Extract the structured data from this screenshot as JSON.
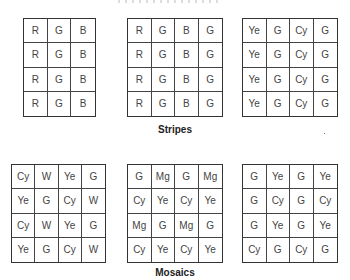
{
  "sections": [
    {
      "title": "Stripes",
      "grids": [
        {
          "name": "rgb-stripe",
          "columns": 3,
          "rows": [
            [
              "R",
              "G",
              "B"
            ],
            [
              "R",
              "G",
              "B"
            ],
            [
              "R",
              "G",
              "B"
            ],
            [
              "R",
              "G",
              "B"
            ]
          ]
        },
        {
          "name": "rgbg-stripe",
          "columns": 4,
          "rows": [
            [
              "R",
              "G",
              "B",
              "G"
            ],
            [
              "R",
              "G",
              "B",
              "G"
            ],
            [
              "R",
              "G",
              "B",
              "G"
            ],
            [
              "R",
              "G",
              "B",
              "G"
            ]
          ]
        },
        {
          "name": "yegcyg-stripe",
          "columns": 4,
          "rows": [
            [
              "Ye",
              "G",
              "Cy",
              "G"
            ],
            [
              "Ye",
              "G",
              "Cy",
              "G"
            ],
            [
              "Ye",
              "G",
              "Cy",
              "G"
            ],
            [
              "Ye",
              "G",
              "Cy",
              "G"
            ]
          ]
        }
      ]
    },
    {
      "title": "Mosaics",
      "grids": [
        {
          "name": "cywyeg-mosaic",
          "columns": 4,
          "rows": [
            [
              "Cy",
              "W",
              "Ye",
              "G"
            ],
            [
              "Ye",
              "G",
              "Cy",
              "W"
            ],
            [
              "Cy",
              "W",
              "Ye",
              "G"
            ],
            [
              "Ye",
              "G",
              "Cy",
              "W"
            ]
          ]
        },
        {
          "name": "gmgcyye-mosaic",
          "columns": 4,
          "rows": [
            [
              "G",
              "Mg",
              "G",
              "Mg"
            ],
            [
              "Cy",
              "Ye",
              "Cy",
              "Ye"
            ],
            [
              "Mg",
              "G",
              "Mg",
              "G"
            ],
            [
              "Cy",
              "Ye",
              "Cy",
              "Ye"
            ]
          ]
        },
        {
          "name": "gyecy-mosaic",
          "columns": 4,
          "rows": [
            [
              "G",
              "Ye",
              "G",
              "Ye"
            ],
            [
              "G",
              "Cy",
              "G",
              "Cy"
            ],
            [
              "G",
              "Ye",
              "G",
              "Ye"
            ],
            [
              "Cy",
              "G",
              "Cy",
              "G"
            ]
          ]
        }
      ]
    }
  ]
}
